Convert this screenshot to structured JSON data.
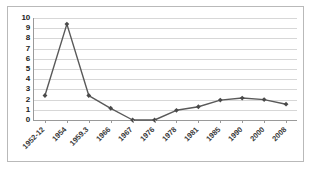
{
  "chart_data": {
    "type": "line",
    "title": "",
    "subtitle": "",
    "xlabel": "",
    "ylabel": "",
    "categories": [
      "1952-12",
      "1954",
      "1959.3",
      "1966",
      "1967",
      "1976",
      "1978",
      "1981",
      "1985",
      "1990",
      "2000",
      "2008"
    ],
    "values": [
      2.4,
      9.4,
      2.4,
      1.15,
      0,
      0,
      0.95,
      1.3,
      1.95,
      2.15,
      2.0,
      1.55
    ],
    "series": [
      {
        "name": "series-1",
        "values": [
          2.4,
          9.4,
          2.4,
          1.15,
          0,
          0,
          0.95,
          1.3,
          1.95,
          2.15,
          2.0,
          1.55
        ]
      }
    ],
    "ylim": [
      0,
      10
    ],
    "y_ticks": [
      0,
      1,
      2,
      3,
      4,
      5,
      6,
      7,
      8,
      9,
      10
    ],
    "y_tick_labels": [
      "0",
      "1",
      "2",
      "3",
      "4",
      "5",
      "6",
      "7",
      "8",
      "9",
      "10"
    ],
    "grid": true,
    "grid_axis": "y",
    "legend": false,
    "legend_position": "none",
    "marker": "diamond",
    "line_color": "#595959",
    "marker_color": "#4a4a4a",
    "grid_color": "#d7d7d7",
    "axis_color": "#9a9a9a",
    "border_color": "#b9b9b9",
    "background_color": "#ffffff",
    "x_tick_label_rotation": -45
  }
}
